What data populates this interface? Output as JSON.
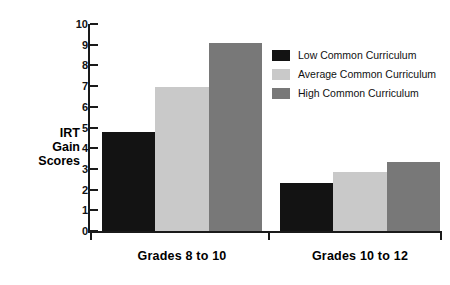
{
  "chart_data": {
    "type": "bar",
    "title": "",
    "xlabel": "",
    "ylabel": "IRT Gain Scores",
    "ylabel_lines": [
      "IRT",
      "Gain",
      "Scores"
    ],
    "categories": [
      "Grades 8 to 10",
      "Grades 10 to 12"
    ],
    "series": [
      {
        "name": "Low Common Curriculum",
        "color": "#131313",
        "values": [
          4.8,
          2.3
        ]
      },
      {
        "name": "Average Common Curriculum",
        "color": "#c9c9c9",
        "values": [
          6.95,
          2.85
        ]
      },
      {
        "name": "High Common Curriculum",
        "color": "#787878",
        "values": [
          9.1,
          3.35
        ]
      }
    ],
    "ylim": [
      0,
      10
    ],
    "ytick_step": 1,
    "yticks": [
      0,
      1,
      2,
      3,
      4,
      5,
      6,
      7,
      8,
      9,
      10
    ],
    "ytick_labels": [
      "0",
      "1",
      "2",
      "3",
      "4",
      "5",
      "6",
      "7",
      "8",
      "9",
      "10"
    ],
    "grid": false,
    "legend_position": "upper right"
  }
}
